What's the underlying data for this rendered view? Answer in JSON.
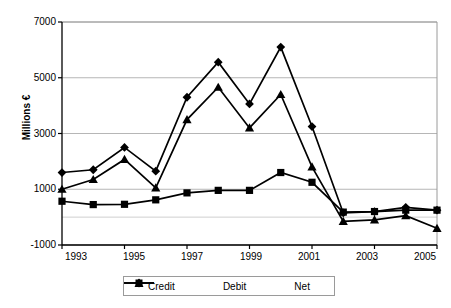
{
  "chart_data": {
    "type": "line",
    "title": "",
    "xlabel": "",
    "ylabel": "Millions €",
    "x": [
      1993,
      1994,
      1995,
      1996,
      1997,
      1998,
      1999,
      2000,
      2001,
      2002,
      2003,
      2004,
      2005
    ],
    "tick_labels_x": [
      "1993",
      "1995",
      "1997",
      "1999",
      "2001",
      "2003",
      "2005"
    ],
    "tick_labels_y": [
      "7000",
      "5000",
      "3000",
      "1000",
      "-1000"
    ],
    "ylim": [
      -1000,
      7000
    ],
    "yticks": [
      -1000,
      1000,
      3000,
      5000,
      7000
    ],
    "grid": true,
    "legend_position": "bottom",
    "series": [
      {
        "name": "Credit",
        "marker": "diamond",
        "color": "#000000",
        "values": [
          1600,
          1700,
          2500,
          1650,
          4300,
          5560,
          4060,
          6100,
          3250,
          150,
          200,
          350,
          250
        ]
      },
      {
        "name": "Debit",
        "marker": "square",
        "color": "#000000",
        "values": [
          570,
          450,
          460,
          620,
          870,
          960,
          960,
          1600,
          1250,
          180,
          200,
          250,
          250
        ]
      },
      {
        "name": "Net",
        "marker": "triangle",
        "color": "#000000",
        "values": [
          1000,
          1350,
          2070,
          1050,
          3500,
          4660,
          3200,
          4400,
          1800,
          -150,
          -100,
          50,
          -400
        ]
      }
    ]
  },
  "legend": {
    "items": [
      {
        "label": "Credit",
        "marker": "diamond-marker"
      },
      {
        "label": "Debit",
        "marker": "square-marker"
      },
      {
        "label": "Net",
        "marker": "triangle-marker"
      }
    ]
  },
  "axis": {
    "y_title": "Millions €"
  }
}
